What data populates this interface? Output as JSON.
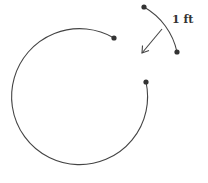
{
  "diagram": {
    "label": "1 ft",
    "colors": {
      "stroke": "#444444",
      "dot": "#333333",
      "background": "#ffffff"
    },
    "large_arc": {
      "center": [
        80,
        97
      ],
      "radius": 68,
      "start": [
        114,
        38
      ],
      "end": [
        146,
        82
      ]
    },
    "small_arc": {
      "start": [
        144,
        7
      ],
      "end": [
        177,
        52
      ]
    },
    "arrow": {
      "from": [
        162,
        29
      ],
      "to": [
        142,
        53
      ]
    }
  }
}
